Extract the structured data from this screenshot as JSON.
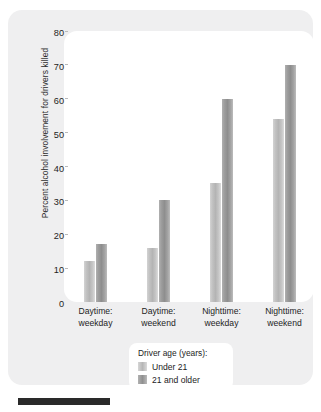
{
  "chart_data": {
    "type": "bar",
    "title": "",
    "xlabel": "",
    "ylabel": "Percent alcohol involvement for drivers killed",
    "ylim": [
      0,
      80
    ],
    "yticks": [
      0,
      10,
      20,
      30,
      40,
      50,
      60,
      70,
      80
    ],
    "grid": false,
    "legend_position": "bottom-center",
    "categories": [
      "Daytime: weekday",
      "Daytime: weekend",
      "Nighttime: weekday",
      "Nighttime: weekend"
    ],
    "category_lines": [
      [
        "Daytime:",
        "weekday"
      ],
      [
        "Daytime:",
        "weekend"
      ],
      [
        "Nighttime:",
        "weekday"
      ],
      [
        "Nighttime:",
        "weekend"
      ]
    ],
    "series": [
      {
        "name": "Under 21",
        "color": "#b8b8b8",
        "values": [
          12,
          16,
          35,
          54
        ]
      },
      {
        "name": "21 and older",
        "color": "#949494",
        "values": [
          17,
          30,
          60,
          70
        ]
      }
    ]
  },
  "legend": {
    "title": "Driver age (years):",
    "entries": [
      {
        "label": "Under 21"
      },
      {
        "label": "21 and older"
      }
    ]
  },
  "axis": {
    "y_title": "Percent alcohol involvement for drivers killed",
    "y_tick_labels": [
      "80",
      "70",
      "60",
      "50",
      "40",
      "30",
      "20",
      "10",
      "0"
    ]
  }
}
